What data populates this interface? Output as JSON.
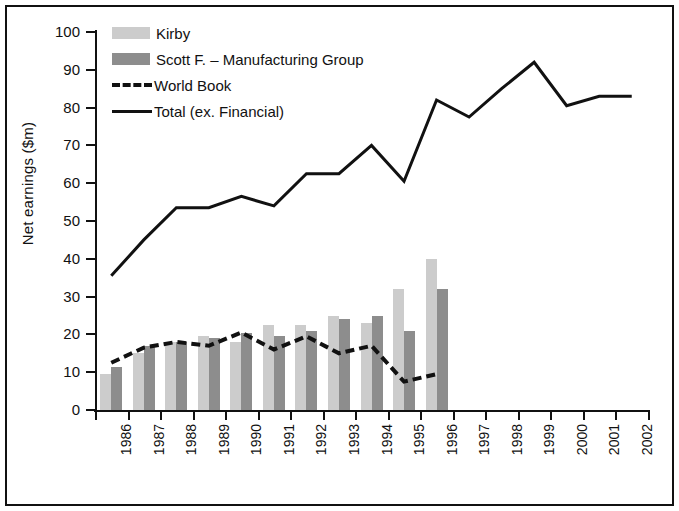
{
  "chart_data": {
    "type": "bar",
    "title": "",
    "xlabel": "",
    "ylabel": "Net earnings ($m)",
    "ylim": [
      0,
      100
    ],
    "yticks": [
      0,
      10,
      20,
      30,
      40,
      50,
      60,
      70,
      80,
      90,
      100
    ],
    "grid": false,
    "legend_position": "top-left",
    "categories": [
      "1986",
      "1987",
      "1988",
      "1989",
      "1990",
      "1991",
      "1992",
      "1993",
      "1994",
      "1995",
      "1996",
      "1997",
      "1998",
      "1999",
      "2000",
      "2001",
      "2002"
    ],
    "series": [
      {
        "name": "Kirby",
        "kind": "bar",
        "color": "#cccccc",
        "values": [
          9.5,
          15,
          18,
          19.5,
          18,
          22.5,
          22.5,
          25,
          23,
          32,
          40,
          null,
          null,
          null,
          null,
          null,
          null
        ]
      },
      {
        "name": "Scott F. – Manufacturing Group",
        "kind": "bar",
        "color": "#8d8d8d",
        "values": [
          11.5,
          17,
          18,
          19,
          20.5,
          19.5,
          21,
          24,
          25,
          21,
          32,
          null,
          null,
          null,
          null,
          null,
          null
        ]
      },
      {
        "name": "World Book",
        "kind": "dashed-line",
        "color": "#111111",
        "values": [
          12.5,
          16.5,
          18,
          17,
          20.5,
          16,
          19.5,
          15,
          17,
          7.5,
          9.5,
          null,
          null,
          null,
          null,
          null,
          null
        ]
      },
      {
        "name": "Total (ex. Financial)",
        "kind": "line",
        "color": "#111111",
        "values": [
          35.5,
          45,
          53.5,
          53.5,
          56.5,
          54,
          62.5,
          62.5,
          70,
          60.5,
          82,
          77.5,
          85,
          92,
          80.5,
          83,
          83
        ]
      }
    ]
  },
  "legend": {
    "items": [
      {
        "label": "Kirby"
      },
      {
        "label": "Scott F. – Manufacturing Group"
      },
      {
        "label": "World Book"
      },
      {
        "label": "Total (ex. Financial)"
      }
    ]
  },
  "colors": {
    "kirby": "#cccccc",
    "scott": "#8d8d8d",
    "line": "#111111",
    "background": "#ffffff",
    "border": "#111111"
  }
}
